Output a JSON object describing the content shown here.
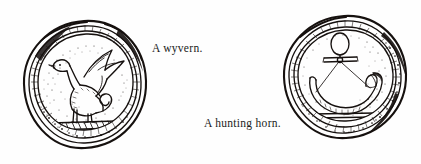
{
  "page": {
    "background_color": "#fefefe",
    "ink_color": "#16110f",
    "width": 421,
    "height": 164
  },
  "figures": [
    {
      "id": "seal-wyvern",
      "icon_name": "wax-seal-wyvern-drawing",
      "subject": "wyvern",
      "description": "Line drawing of a medieval wax seal impression showing a wyvern: a winged two-legged dragon with a bird-like head, raised wing and coiled serpent tail, standing on a hatched ground bar.",
      "caption": "A wyvern."
    },
    {
      "id": "seal-horn",
      "icon_name": "wax-seal-hunting-horn-drawing",
      "subject": "hunting horn",
      "description": "Line drawing of a medieval wax seal impression showing a hunting horn: a crescent horn with flared bell, suspended from a looped ring and strap, above a plain bar.",
      "caption": "A hunting horn."
    }
  ],
  "captions": {
    "wyvern": "A wyvern.",
    "hunting_horn": "A hunting horn."
  }
}
